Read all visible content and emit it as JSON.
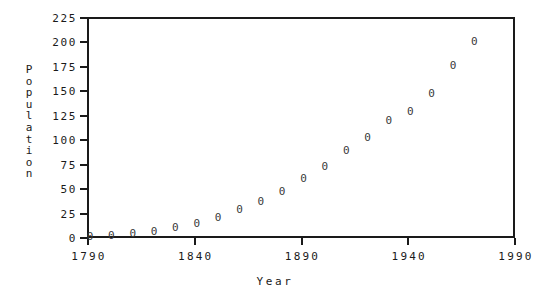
{
  "chart_data": {
    "type": "scatter",
    "title": "",
    "xlabel": "Year",
    "ylabel": "Population",
    "xlim": [
      1790,
      1990
    ],
    "ylim": [
      0,
      225
    ],
    "xticks": [
      1790,
      1840,
      1890,
      1940,
      1990
    ],
    "xtick_labels": [
      "1790",
      "1840",
      "1890",
      "1940",
      "1990"
    ],
    "yticks": [
      0,
      25,
      50,
      75,
      100,
      125,
      150,
      175,
      200,
      225
    ],
    "ytick_labels": [
      "0",
      "25",
      "50",
      "75",
      "100",
      "125",
      "150",
      "175",
      "200",
      "225"
    ],
    "grid": false,
    "legend": null,
    "marker": "0",
    "marker_color": "#3a3a3a",
    "frame_color": "#1a1a1a",
    "background": "#ffffff",
    "x": [
      1790,
      1800,
      1810,
      1820,
      1830,
      1840,
      1850,
      1860,
      1870,
      1880,
      1890,
      1900,
      1910,
      1920,
      1930,
      1940,
      1950,
      1960,
      1970
    ],
    "y": [
      3.9,
      5.3,
      7.2,
      9.6,
      12.9,
      17.1,
      23.2,
      31.4,
      39.8,
      50.2,
      62.9,
      76.0,
      92.0,
      105.7,
      122.8,
      131.7,
      150.7,
      179.3,
      203.2
    ],
    "points": [
      {
        "x": 1790,
        "y": 3.9
      },
      {
        "x": 1800,
        "y": 5.3
      },
      {
        "x": 1810,
        "y": 7.2
      },
      {
        "x": 1820,
        "y": 9.6
      },
      {
        "x": 1830,
        "y": 12.9
      },
      {
        "x": 1840,
        "y": 17.1
      },
      {
        "x": 1850,
        "y": 23.2
      },
      {
        "x": 1860,
        "y": 31.4
      },
      {
        "x": 1870,
        "y": 39.8
      },
      {
        "x": 1880,
        "y": 50.2
      },
      {
        "x": 1890,
        "y": 62.9
      },
      {
        "x": 1900,
        "y": 76.0
      },
      {
        "x": 1910,
        "y": 92.0
      },
      {
        "x": 1920,
        "y": 105.7
      },
      {
        "x": 1930,
        "y": 122.8
      },
      {
        "x": 1940,
        "y": 131.7
      },
      {
        "x": 1950,
        "y": 150.7
      },
      {
        "x": 1960,
        "y": 179.3
      },
      {
        "x": 1970,
        "y": 203.2
      }
    ]
  },
  "ylabel_letters": [
    "P",
    "o",
    "p",
    "u",
    "l",
    "a",
    "t",
    "i",
    "o",
    "n"
  ]
}
